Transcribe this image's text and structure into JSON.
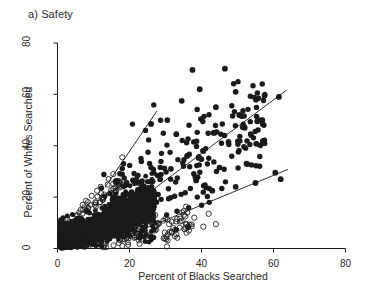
{
  "figure": {
    "panel_title": "a) Safety",
    "background_color": "#fdfdfc",
    "ink_color": "#1a1a1a"
  },
  "chart_data": {
    "type": "scatter",
    "title": "a) Safety",
    "xlabel": "Percent of Blacks Searched",
    "ylabel": "Percent of Whites Searched",
    "xlim": [
      0,
      82
    ],
    "ylim": [
      0,
      84
    ],
    "xticks": [
      0,
      20,
      40,
      60,
      80
    ],
    "yticks": [
      0,
      20,
      40,
      60,
      80
    ],
    "xtick_labels": [
      "0",
      "20",
      "40",
      "60",
      "80"
    ],
    "ytick_labels": [
      "0",
      "20",
      "40",
      "60",
      "80"
    ],
    "grid": false,
    "legend": null,
    "axis_style": "L-shaped open frame, ticks outward",
    "series": [
      {
        "name": "filled-points",
        "marker": "filled-circle",
        "color": "#111111",
        "size": 3.0,
        "description": "Dense black cluster near the origin fanning out along a positive diagonal; isolated filled points extend to roughly (62, 60)."
      },
      {
        "name": "open-points",
        "marker": "open-circle",
        "color": "#111111",
        "size": 3.2,
        "description": "Hollow circles forming the lower-right fringe below the shallow reference line and a thin upper-left fringe."
      }
    ],
    "reference_lines": [
      {
        "name": "steep-line",
        "x": [
          13.2,
          27.6
        ],
        "y": [
          23.8,
          53.5
        ],
        "style": "solid",
        "width": 0.9
      },
      {
        "name": "middle-line",
        "x": [
          14.6,
          63.5
        ],
        "y": [
          10.5,
          61.5
        ],
        "style": "solid",
        "width": 0.9
      },
      {
        "name": "shallow-line",
        "x": [
          17.8,
          64.0
        ],
        "y": [
          4.0,
          30.8
        ],
        "style": "solid",
        "width": 0.9
      }
    ]
  }
}
